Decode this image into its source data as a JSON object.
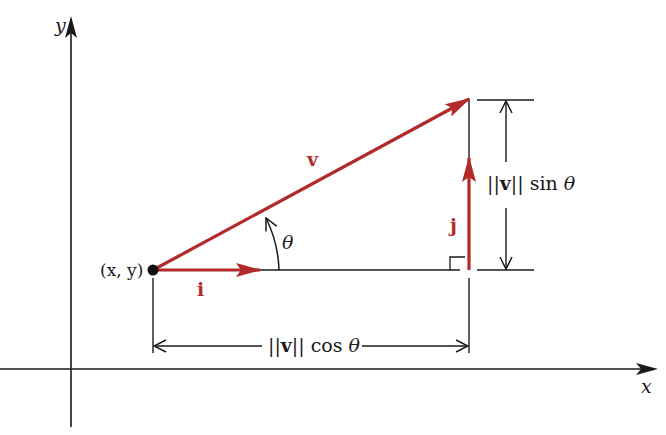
{
  "diagram": {
    "title": "",
    "axes": {
      "x_label": "x",
      "y_label": "y"
    },
    "point": {
      "label": "(x, y)"
    },
    "vectors": {
      "v": {
        "label": "v",
        "color": "#b22a2a"
      },
      "i": {
        "label": "i",
        "color": "#b22a2a"
      },
      "j": {
        "label": "j",
        "color": "#b22a2a"
      }
    },
    "angle": {
      "label": "θ"
    },
    "dimensions": {
      "horizontal": {
        "norm": "||v||",
        "func": "cos",
        "angle": "θ"
      },
      "vertical": {
        "norm": "||v||",
        "func": "sin",
        "angle": "θ"
      }
    },
    "colors": {
      "vector": "#b22a2a",
      "line": "#1a1a1a",
      "background": "#ffffff"
    }
  }
}
